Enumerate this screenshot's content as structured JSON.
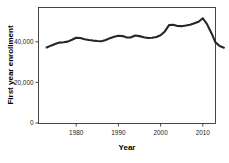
{
  "chart_data": {
    "type": "line",
    "title": "",
    "xlabel": "Year",
    "ylabel": "First year enrollment",
    "xlim": [
      1972,
      2016
    ],
    "ylim": [
      0,
      55000
    ],
    "grid": false,
    "legend": null,
    "xticks": [
      1980,
      1990,
      2000,
      2010
    ],
    "xtick_labels": [
      "1980",
      "1990",
      "2000",
      "2010"
    ],
    "yticks": [
      0,
      20000,
      40000
    ],
    "ytick_labels": [
      "0",
      "20,000",
      "40,000"
    ],
    "line_color": "#262626",
    "x": [
      1973,
      1974,
      1975,
      1976,
      1977,
      1978,
      1979,
      1980,
      1981,
      1982,
      1983,
      1984,
      1985,
      1986,
      1987,
      1988,
      1989,
      1990,
      1991,
      1992,
      1993,
      1994,
      1995,
      1996,
      1997,
      1998,
      1999,
      2000,
      2001,
      2002,
      2003,
      2004,
      2005,
      2006,
      2007,
      2008,
      2009,
      2010,
      2011,
      2012,
      2013,
      2014,
      2015
    ],
    "values": [
      37200,
      38100,
      38900,
      39600,
      39800,
      40100,
      41000,
      42000,
      41900,
      41300,
      40900,
      40600,
      40400,
      40300,
      40900,
      41800,
      42500,
      43000,
      42800,
      42100,
      42200,
      43100,
      42800,
      42200,
      41900,
      42000,
      42400,
      43200,
      45100,
      48200,
      48400,
      47800,
      47700,
      48000,
      48400,
      49100,
      49900,
      51600,
      48700,
      44500,
      39700,
      37900,
      37100
    ],
    "series_name": "First year enrollment"
  },
  "axis": {
    "y_title": "First year enrollment",
    "x_title": "Year"
  }
}
